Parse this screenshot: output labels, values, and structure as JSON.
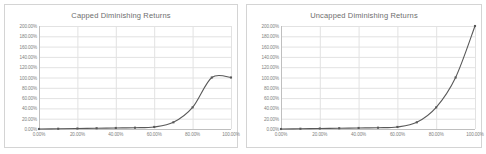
{
  "chart_data": [
    {
      "type": "line",
      "id": "capped",
      "title": "Capped Diminishing Returns",
      "xlabel": "",
      "ylabel": "",
      "x": [
        0,
        0.1,
        0.2,
        0.3,
        0.4,
        0.5,
        0.6,
        0.7,
        0.8,
        0.9,
        1.0
      ],
      "x_tick_labels": [
        "0.00%",
        "20.00%",
        "40.00%",
        "60.00%",
        "80.00%",
        "100.00%"
      ],
      "x_tick_values": [
        0,
        0.2,
        0.4,
        0.6,
        0.8,
        1.0
      ],
      "xlim": [
        0,
        1.0
      ],
      "y_tick_labels": [
        "0.00%",
        "20.00%",
        "40.00%",
        "60.00%",
        "80.00%",
        "100.00%",
        "120.00%",
        "140.00%",
        "160.00%",
        "180.00%",
        "200.00%"
      ],
      "y_tick_values": [
        0,
        0.2,
        0.4,
        0.6,
        0.8,
        1.0,
        1.2,
        1.4,
        1.6,
        1.8,
        2.0
      ],
      "ylim": [
        0,
        2.0
      ],
      "values": [
        0,
        0.005,
        0.01,
        0.015,
        0.02,
        0.025,
        0.04,
        0.13,
        0.42,
        1.0,
        1.0
      ],
      "value_labels": [
        "0.00%",
        "0.50%",
        "1.00%",
        "1.50%",
        "2.00%",
        "2.50%",
        "4.00%",
        "13.00%",
        "42.00%",
        "100.00%",
        "100.00%"
      ],
      "grid": true,
      "legend": "none",
      "line_color": "#595959",
      "marker": "square",
      "marker_color": "#595959"
    },
    {
      "type": "line",
      "id": "uncapped",
      "title": "Uncapped Diminishing Returns",
      "xlabel": "",
      "ylabel": "",
      "x": [
        0,
        0.1,
        0.2,
        0.3,
        0.4,
        0.5,
        0.6,
        0.7,
        0.8,
        0.9,
        1.0
      ],
      "x_tick_labels": [
        "0.00%",
        "20.00%",
        "40.00%",
        "60.00%",
        "80.00%",
        "100.00%"
      ],
      "x_tick_values": [
        0,
        0.2,
        0.4,
        0.6,
        0.8,
        1.0
      ],
      "xlim": [
        0,
        1.0
      ],
      "y_tick_labels": [
        "0.00%",
        "20.00%",
        "40.00%",
        "60.00%",
        "80.00%",
        "100.00%",
        "120.00%",
        "140.00%",
        "160.00%",
        "180.00%",
        "200.00%"
      ],
      "y_tick_values": [
        0,
        0.2,
        0.4,
        0.6,
        0.8,
        1.0,
        1.2,
        1.4,
        1.6,
        1.8,
        2.0
      ],
      "ylim": [
        0,
        2.0
      ],
      "values": [
        0,
        0.005,
        0.01,
        0.015,
        0.02,
        0.025,
        0.04,
        0.13,
        0.42,
        1.0,
        2.0
      ],
      "value_labels": [
        "0.00%",
        "0.50%",
        "1.00%",
        "1.50%",
        "2.00%",
        "2.50%",
        "4.00%",
        "13.00%",
        "42.00%",
        "100.00%",
        "200.00%"
      ],
      "grid": true,
      "legend": "none",
      "line_color": "#595959",
      "marker": "square",
      "marker_color": "#595959"
    }
  ],
  "colors": {
    "panel_border": "#d4d4d4",
    "gridline": "#e2e2e2",
    "axis_line": "#bfbfbf",
    "tick_text": "#808080",
    "title_text": "#6e6e6e",
    "series_line": "#595959",
    "background": "#ffffff"
  }
}
